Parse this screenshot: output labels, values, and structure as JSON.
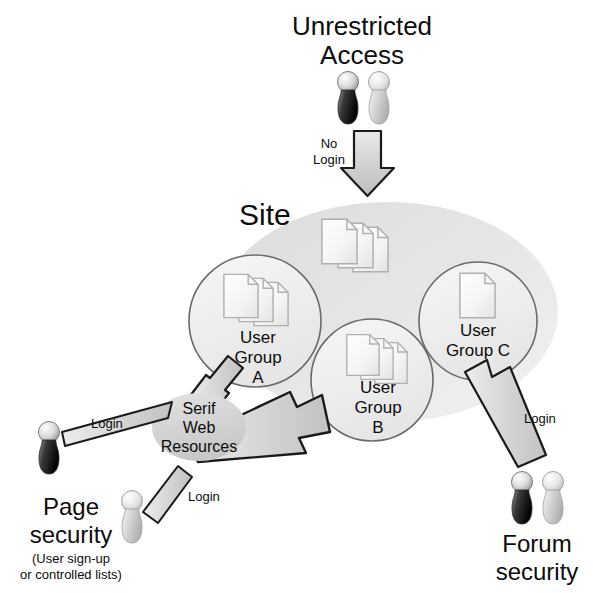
{
  "diagram": {
    "title_top": {
      "line1": "Unrestricted",
      "line2": "Access"
    },
    "site_label": "Site",
    "no_login_label": {
      "line1": "No",
      "line2": "Login"
    },
    "groups": [
      {
        "id": "a",
        "line1": "User",
        "line2": "Group",
        "line3": "A",
        "docs": 3
      },
      {
        "id": "b",
        "line1": "User",
        "line2": "Group",
        "line3": "B",
        "docs": 3
      },
      {
        "id": "c",
        "line1": "User",
        "line2": "Group C",
        "line3": "",
        "docs": 1
      }
    ],
    "site_docs": 3,
    "hub": {
      "line1": "Serif",
      "line2": "Web",
      "line3": "Resources"
    },
    "edge_labels": {
      "login_top_left": "Login",
      "login_bottom_left": "Login",
      "login_right": "Login"
    },
    "page_security": {
      "line1": "Page",
      "line2": "security",
      "note1": "(User sign-up",
      "note2": "or controlled lists)"
    },
    "forum_security": {
      "line1": "Forum",
      "line2": "security"
    },
    "colors": {
      "background": "#ffffff",
      "text": "#0d0d0d",
      "site_fill": "#e4e4e4",
      "group_fill": "#efefef",
      "group_stroke": "#666666",
      "hub_fill": "#d8d8d8",
      "arrow_fill": "#d6d6d6",
      "arrow_stroke": "#1a1a1a",
      "doc_fill": "#fbfbfb",
      "doc_stroke": "#b4b4b4",
      "person_dark": "#141414",
      "person_light": "#cccccc"
    }
  }
}
